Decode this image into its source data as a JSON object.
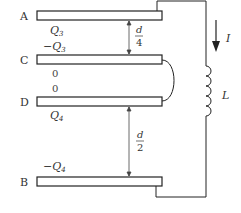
{
  "plates": [
    {
      "label": "A"
    },
    {
      "label": "C"
    },
    {
      "label": "D"
    },
    {
      "label": "B"
    }
  ],
  "charges": {
    "a_bottom": {
      "sym": "Q",
      "sub": "3",
      "sign": ""
    },
    "c_top": {
      "sym": "Q",
      "sub": "3",
      "sign": "−"
    },
    "c_bottom": "0",
    "d_top": "0",
    "d_bottom": {
      "sym": "Q",
      "sub": "4",
      "sign": ""
    },
    "b_top": {
      "sym": "Q",
      "sub": "4",
      "sign": "−"
    }
  },
  "gaps": {
    "ac": {
      "num": "d",
      "den": "4"
    },
    "db": {
      "num": "d",
      "den": "2"
    }
  },
  "current_label": "I",
  "inductor_label": "L"
}
